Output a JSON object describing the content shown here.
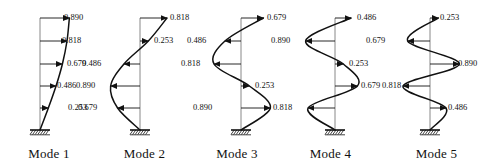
{
  "figure": {
    "title": "",
    "stroke_color": "#111111",
    "axis_color": "#888888",
    "background": "#ffffff",
    "panel_count": 5,
    "levels": 5
  },
  "modes": [
    {
      "caption": "Mode 1",
      "panel_left": 0,
      "panel_width": 98,
      "axis_x": 40,
      "base_y": 130,
      "top_y": 18,
      "amplitude_scale": 33,
      "curve_style": "smooth",
      "levels": [
        {
          "label": "0.253",
          "value": 0.253,
          "y": 108,
          "dir": "right",
          "label_x": 68,
          "label_y": 103
        },
        {
          "label": "0.486",
          "value": 0.486,
          "y": 86,
          "dir": "right",
          "label_x": 57,
          "label_y": 81
        },
        {
          "label": "0.679",
          "value": 0.679,
          "y": 64,
          "dir": "right",
          "label_x": 67,
          "label_y": 59
        },
        {
          "label": "0.818",
          "value": 0.818,
          "y": 41,
          "dir": "right",
          "label_x": 62,
          "label_y": 36
        },
        {
          "label": "0.890",
          "value": 0.89,
          "y": 18,
          "dir": "right",
          "label_x": 64,
          "label_y": 13
        }
      ]
    },
    {
      "caption": "Mode 2",
      "panel_left": 98,
      "panel_width": 93,
      "axis_x": 42,
      "base_y": 130,
      "top_y": 18,
      "amplitude_scale": 33,
      "curve_style": "smooth",
      "levels": [
        {
          "label": "0.679",
          "value": -0.679,
          "y": 108,
          "dir": "left",
          "label_x": -20,
          "label_y": 103
        },
        {
          "label": "0.890",
          "value": -0.89,
          "y": 86,
          "dir": "left",
          "label_x": -22,
          "label_y": 81
        },
        {
          "label": "0.486",
          "value": -0.486,
          "y": 64,
          "dir": "left",
          "label_x": -16,
          "label_y": 59
        },
        {
          "label": "0.253",
          "value": 0.253,
          "y": 41,
          "dir": "right",
          "label_x": 56,
          "label_y": 36
        },
        {
          "label": "0.818",
          "value": 0.818,
          "y": 18,
          "dir": "right",
          "label_x": 72,
          "label_y": 13
        }
      ]
    },
    {
      "caption": "Mode 3",
      "panel_left": 191,
      "panel_width": 92,
      "axis_x": 50,
      "base_y": 130,
      "top_y": 18,
      "amplitude_scale": 33,
      "curve_style": "smooth",
      "levels": [
        {
          "label": "0.890",
          "value": 0.89,
          "y": 108,
          "dir": "right",
          "label_x": 2,
          "label_y": 103
        },
        {
          "label": "0.253",
          "value": 0.253,
          "y": 86,
          "dir": "right",
          "label_x": 64,
          "label_y": 81
        },
        {
          "label": "0.818",
          "value": -0.818,
          "y": 64,
          "dir": "left",
          "label_x": -10,
          "label_y": 59
        },
        {
          "label": "0.486",
          "value": -0.486,
          "y": 41,
          "dir": "left",
          "label_x": -4,
          "label_y": 36
        },
        {
          "label": "0.679",
          "value": 0.679,
          "y": 18,
          "dir": "right",
          "label_x": 76,
          "label_y": 13
        }
      ]
    },
    {
      "caption": "Mode 4",
      "panel_left": 283,
      "panel_width": 95,
      "axis_x": 52,
      "base_y": 130,
      "top_y": 18,
      "amplitude_scale": 33,
      "curve_style": "smooth",
      "levels": [
        {
          "label": "0.818",
          "value": -0.818,
          "y": 108,
          "dir": "left",
          "label_x": -10,
          "label_y": 103
        },
        {
          "label": "0.679",
          "value": 0.679,
          "y": 86,
          "dir": "right",
          "label_x": 78,
          "label_y": 81
        },
        {
          "label": "0.253",
          "value": 0.253,
          "y": 64,
          "dir": "right",
          "label_x": 66,
          "label_y": 59
        },
        {
          "label": "0.890",
          "value": -0.89,
          "y": 41,
          "dir": "left",
          "label_x": -12,
          "label_y": 36
        },
        {
          "label": "0.486",
          "value": 0.486,
          "y": 18,
          "dir": "right",
          "label_x": 74,
          "label_y": 13
        }
      ]
    },
    {
      "caption": "Mode 5",
      "panel_left": 378,
      "panel_width": 117,
      "axis_x": 52,
      "base_y": 130,
      "top_y": 18,
      "amplitude_scale": 33,
      "curve_style": "smooth",
      "levels": [
        {
          "label": "0.486",
          "value": 0.486,
          "y": 108,
          "dir": "right",
          "label_x": 70,
          "label_y": 103
        },
        {
          "label": "0.818",
          "value": -0.818,
          "y": 86,
          "dir": "left",
          "label_x": 4,
          "label_y": 81
        },
        {
          "label": "0.890",
          "value": 0.89,
          "y": 64,
          "dir": "right",
          "label_x": 80,
          "label_y": 59
        },
        {
          "label": "0.679",
          "value": -0.679,
          "y": 41,
          "dir": "left",
          "label_x": -12,
          "label_y": 36
        },
        {
          "label": "0.253",
          "value": 0.253,
          "y": 18,
          "dir": "right",
          "label_x": 62,
          "label_y": 13
        }
      ]
    }
  ]
}
